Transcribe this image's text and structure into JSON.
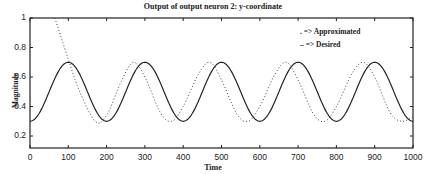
{
  "chart_data": {
    "type": "line",
    "title": "Output of output neuron 2: y-coordinate",
    "xlabel": "Time",
    "ylabel": "Magnitude",
    "xlim": [
      0,
      1000
    ],
    "ylim": [
      0.12,
      1.0
    ],
    "xticks": [
      0,
      100,
      200,
      300,
      400,
      500,
      600,
      700,
      800,
      900,
      1000
    ],
    "yticks": [
      0.2,
      0.4,
      0.6,
      0.8,
      1
    ],
    "ytick_labels": [
      "0.2",
      "0.4",
      "0.6",
      "0.8",
      "1"
    ],
    "grid": false,
    "legend_position": "upper right",
    "legend": [
      {
        "marker": ". =>",
        "label": "Approximated",
        "style": "dotted"
      },
      {
        "marker": "– =>",
        "label": "Desired",
        "style": "solid"
      }
    ],
    "series": [
      {
        "name": "Desired",
        "style": "solid",
        "formula": "0.5 - 0.2*cos(2*pi*t/200)",
        "x": [
          0,
          50,
          100,
          150,
          200,
          250,
          300,
          350,
          400,
          450,
          500,
          550,
          600,
          650,
          700,
          750,
          800,
          850,
          900,
          950,
          1000
        ],
        "values": [
          0.3,
          0.5,
          0.7,
          0.5,
          0.3,
          0.5,
          0.7,
          0.5,
          0.3,
          0.5,
          0.7,
          0.5,
          0.3,
          0.5,
          0.7,
          0.5,
          0.3,
          0.5,
          0.7,
          0.5,
          0.3
        ]
      },
      {
        "name": "Approximated",
        "style": "dotted",
        "x": [
          65,
          100,
          130,
          170,
          200,
          240,
          270,
          300,
          340,
          370,
          400,
          440,
          470,
          500,
          540,
          570,
          600,
          640,
          670,
          700,
          740,
          770,
          800,
          840,
          870,
          900,
          940,
          970,
          1000
        ],
        "values": [
          1.0,
          0.72,
          0.5,
          0.3,
          0.34,
          0.58,
          0.7,
          0.6,
          0.36,
          0.3,
          0.4,
          0.62,
          0.7,
          0.58,
          0.35,
          0.3,
          0.4,
          0.62,
          0.7,
          0.58,
          0.35,
          0.3,
          0.4,
          0.62,
          0.7,
          0.6,
          0.36,
          0.3,
          0.33
        ]
      }
    ]
  }
}
